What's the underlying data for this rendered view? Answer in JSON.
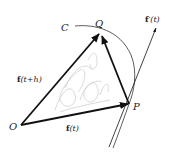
{
  "diagram": {
    "type": "vector-derivative-figure",
    "points": {
      "O": {
        "label": "O",
        "x": 21,
        "y": 125
      },
      "P": {
        "label": "P",
        "x": 129,
        "y": 104
      },
      "Q": {
        "label": "Q",
        "x": 100,
        "y": 33
      }
    },
    "labels": {
      "curve": "C",
      "origin": "O",
      "point_p": "P",
      "point_q": "Q",
      "vec_f_t_bold": "f",
      "vec_f_t_arg": "(t)",
      "vec_f_th_bold": "f",
      "vec_f_th_arg": "(t+h)",
      "deriv_bold": "f",
      "deriv_arg": "′(t)"
    },
    "vectors": [
      {
        "name": "f(t)",
        "from": "O",
        "to": "P"
      },
      {
        "name": "f(t+h)",
        "from": "O",
        "to": "Q"
      },
      {
        "name": "f(t+h)-f(t)",
        "from": "P",
        "to": "Q"
      },
      {
        "name": "f'(t)",
        "from": "P",
        "direction": "tangent"
      }
    ],
    "colors": {
      "stroke": "#111111",
      "curve": "#333333",
      "scribble": "#c8c8c8"
    }
  }
}
